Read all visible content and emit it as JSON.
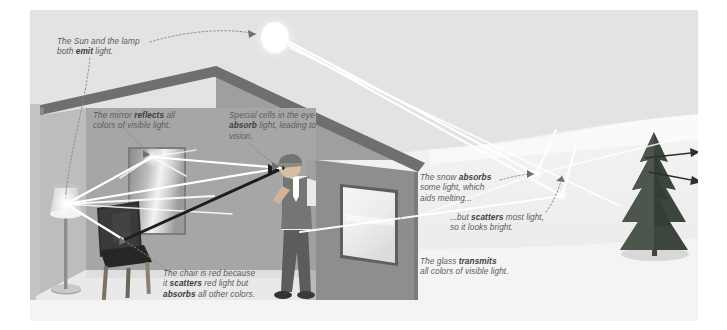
{
  "figure": {
    "palette": {
      "sky": "#e3e3e3",
      "snow": "#f2f2f2",
      "roof_dark": "#6f6f6f",
      "roof_light": "#a8a8a8",
      "wall_front": "#b0b0b0",
      "wall_right": "#8e8e8e",
      "floor": "#e9e9e9",
      "interior_back": "#a8a8a8",
      "ray_light": "#ffffff",
      "ray_dark": "#1d1d1d",
      "caption_text": "#5d5d5d",
      "caption_bold": "#404040",
      "leader_line": "#8a8a8a",
      "sun": "#ffffff",
      "tree": "#3f4a40",
      "chair": "#2b2b2b",
      "person_vest": "#737373",
      "person_pants": "#5c5c5c"
    },
    "captions": [
      {
        "name": "sun-lamp-emit",
        "text_parts": [
          {
            "text": "The Sun and the lamp\nboth ",
            "bold": false
          },
          {
            "text": "emit",
            "bold": true
          },
          {
            "text": " light.",
            "bold": false
          }
        ],
        "plain": "The Sun and the lamp both emit light."
      },
      {
        "name": "mirror-reflects",
        "text_parts": [
          {
            "text": "The mirror ",
            "bold": false
          },
          {
            "text": "reflects",
            "bold": true
          },
          {
            "text": " all\ncolors of visible light.",
            "bold": false
          }
        ],
        "plain": "The mirror reflects all colors of visible light."
      },
      {
        "name": "eye-absorbs",
        "text_parts": [
          {
            "text": "Special cells in the eye\n",
            "bold": false
          },
          {
            "text": "absorb",
            "bold": true
          },
          {
            "text": " light, leading to\nvision.",
            "bold": false
          }
        ],
        "plain": "Special cells in the eye absorb light, leading to vision."
      },
      {
        "name": "snow-absorbs",
        "text_parts": [
          {
            "text": "The snow ",
            "bold": false
          },
          {
            "text": "absorbs",
            "bold": true
          },
          {
            "text": "\nsome light, which\naids melting...",
            "bold": false
          }
        ],
        "plain": "The snow absorbs some light, which aids melting..."
      },
      {
        "name": "snow-scatters",
        "text_parts": [
          {
            "text": "...but ",
            "bold": false
          },
          {
            "text": "scatters",
            "bold": true
          },
          {
            "text": " most light,\nso it looks bright.",
            "bold": false
          }
        ],
        "plain": "...but scatters most light, so it looks bright."
      },
      {
        "name": "glass-transmits",
        "text_parts": [
          {
            "text": "The glass ",
            "bold": false
          },
          {
            "text": "transmits",
            "bold": true
          },
          {
            "text": "\nall colors of visible light.",
            "bold": false
          }
        ],
        "plain": "The glass transmits all colors of visible light."
      },
      {
        "name": "chair-scatters-absorbs",
        "text_parts": [
          {
            "text": "The chair is red because\nit ",
            "bold": false
          },
          {
            "text": "scatters",
            "bold": true
          },
          {
            "text": " red light but\n",
            "bold": false
          },
          {
            "text": "absorbs",
            "bold": true
          },
          {
            "text": " all other colors.",
            "bold": false
          }
        ],
        "plain": "The chair is red because it scatters red light but absorbs all other colors."
      }
    ],
    "objects": [
      {
        "name": "sun",
        "label": "Sun"
      },
      {
        "name": "house",
        "label": "House with cut-away wall"
      },
      {
        "name": "mirror",
        "label": "Mirror on back wall"
      },
      {
        "name": "window",
        "label": "Glass window on right wall"
      },
      {
        "name": "floor-lamp",
        "label": "Floor lamp"
      },
      {
        "name": "chair",
        "label": "Red chair"
      },
      {
        "name": "person",
        "label": "Person looking toward mirror"
      },
      {
        "name": "evergreen-tree",
        "label": "Evergreen tree"
      },
      {
        "name": "snow-hill",
        "label": "Snow-covered ground"
      }
    ]
  }
}
